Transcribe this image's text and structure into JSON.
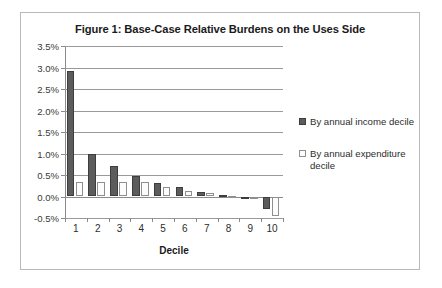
{
  "figure": {
    "title": "Figure 1: Base-Case Relative Burdens on the Uses Side"
  },
  "chart_data": {
    "type": "bar",
    "title": "Figure 1: Base-Case Relative Burdens on the Uses Side",
    "xlabel": "Decile",
    "ylabel": "",
    "categories": [
      "1",
      "2",
      "3",
      "4",
      "5",
      "6",
      "7",
      "8",
      "9",
      "10"
    ],
    "series": [
      {
        "name": "By annual income decile",
        "values": [
          2.93,
          0.98,
          0.72,
          0.47,
          0.32,
          0.22,
          0.11,
          0.03,
          -0.05,
          -0.29
        ]
      },
      {
        "name": "By annual expenditure decile",
        "values": [
          0.34,
          0.33,
          0.33,
          0.33,
          0.22,
          0.13,
          0.07,
          0.02,
          -0.02,
          -0.45
        ]
      }
    ],
    "ylim": [
      -0.5,
      3.5
    ],
    "ytick_values": [
      3.5,
      3.0,
      2.5,
      2.0,
      1.5,
      1.0,
      0.5,
      0.0,
      -0.5
    ],
    "ytick_labels": [
      "3.5%",
      "3.0%",
      "2.5%",
      "2.0%",
      "1.5%",
      "1.0%",
      "0.5%",
      "0.0%",
      "-0.5%"
    ],
    "grid": true,
    "legend_position": "right",
    "value_unit": "percent",
    "colors": {
      "series_income": "#5c5c5c",
      "series_expenditure": "#fcfcfc",
      "gridline": "#9a9a9a",
      "axis": "#8a8a8a",
      "frame_border": "#b9b9b9",
      "text": "#2d2d2d"
    }
  },
  "legend": {
    "entries": [
      {
        "label": "By annual income decile",
        "swatch": "filled-dark-square"
      },
      {
        "label": "By annual expenditure decile",
        "swatch": "open-light-square"
      }
    ]
  }
}
